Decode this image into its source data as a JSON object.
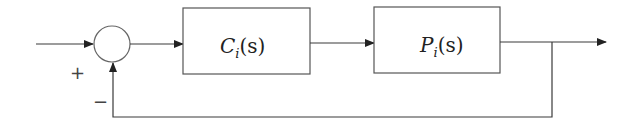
{
  "diagram": {
    "type": "feedback-control-block-diagram",
    "blocks": [
      {
        "id": "controller",
        "symbol": "C",
        "subscript": "i",
        "arg": "(s)"
      },
      {
        "id": "plant",
        "symbol": "P",
        "subscript": "i",
        "arg": "(s)"
      }
    ],
    "summing_junction": {
      "plus_sign": "+",
      "minus_sign": "−"
    },
    "colors": {
      "line": "#3a3a3a",
      "box_border": "#555555",
      "text": "#222222",
      "background": "#ffffff"
    }
  }
}
